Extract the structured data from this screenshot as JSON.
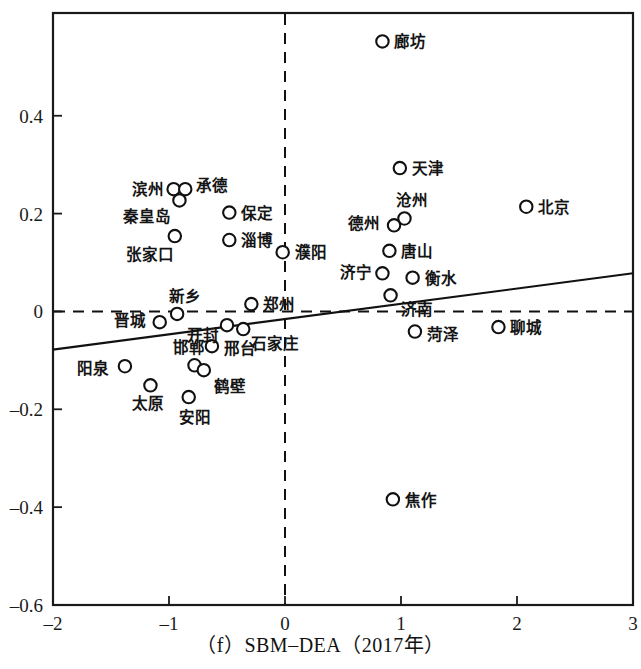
{
  "caption": "（f）SBM–DEA（2017年）",
  "axes": {
    "x_ticks": [
      "-2",
      "-1",
      "0",
      "1",
      "2",
      "3"
    ],
    "x_tick_values": [
      -2,
      -1,
      0,
      1,
      2,
      3
    ],
    "y_ticks": [
      "0.4",
      "0.2",
      "0",
      "-0.2",
      "-0.4",
      "-0.6"
    ],
    "y_tick_values": [
      0.4,
      0.2,
      0,
      -0.2,
      -0.4,
      -0.6
    ],
    "xlim": [
      -2,
      3
    ],
    "ylim": [
      -0.6,
      0.61
    ],
    "xlabel": "",
    "ylabel": ""
  },
  "chart_data": {
    "type": "scatter",
    "title": "（f）SBM–DEA（2017年）",
    "xlabel": "",
    "ylabel": "",
    "xlim": [
      -2,
      3
    ],
    "ylim": [
      -0.6,
      0.61
    ],
    "grid": false,
    "legend": null,
    "reference_lines": [
      {
        "name": "zero-horizontal",
        "orient": "h",
        "value": 0,
        "style": "dashed"
      },
      {
        "name": "zero-vertical",
        "orient": "v",
        "value": 0,
        "style": "dashed"
      }
    ],
    "trend_line": {
      "name": "fitted-regression-line",
      "style": "solid",
      "x0": -2,
      "y0": -0.078,
      "x1": 3,
      "y1": 0.078,
      "slope": 0.0312,
      "intercept": 0.0
    },
    "points": [
      {
        "label": "廊坊",
        "x": 0.84,
        "y": 0.552,
        "lx": 12,
        "ly": 6
      },
      {
        "label": "滨州",
        "x": -0.96,
        "y": 0.25,
        "lx": -42,
        "ly": 6
      },
      {
        "label": "承德",
        "x": -0.86,
        "y": 0.25,
        "lx": 11,
        "ly": 2
      },
      {
        "label": "秦皇岛",
        "x": -0.91,
        "y": 0.227,
        "lx": -56,
        "ly": 22
      },
      {
        "label": "张家口",
        "x": -0.95,
        "y": 0.154,
        "lx": -49,
        "ly": 24
      },
      {
        "label": "保定",
        "x": -0.48,
        "y": 0.202,
        "lx": 12,
        "ly": 6
      },
      {
        "label": "淄博",
        "x": -0.48,
        "y": 0.146,
        "lx": 12,
        "ly": 6
      },
      {
        "label": "濮阳",
        "x": -0.02,
        "y": 0.121,
        "lx": 12,
        "ly": 6
      },
      {
        "label": "天津",
        "x": 0.99,
        "y": 0.293,
        "lx": 12,
        "ly": 6
      },
      {
        "label": "北京",
        "x": 2.08,
        "y": 0.214,
        "lx": 12,
        "ly": 6
      },
      {
        "label": "沧州",
        "x": 1.03,
        "y": 0.19,
        "lx": -8,
        "ly": -12
      },
      {
        "label": "德州",
        "x": 0.94,
        "y": 0.176,
        "lx": -46,
        "ly": 4
      },
      {
        "label": "唐山",
        "x": 0.9,
        "y": 0.124,
        "lx": 12,
        "ly": 6
      },
      {
        "label": "济宁",
        "x": 0.84,
        "y": 0.078,
        "lx": -42,
        "ly": 5
      },
      {
        "label": "衡水",
        "x": 1.1,
        "y": 0.069,
        "lx": 12,
        "ly": 6
      },
      {
        "label": "济南",
        "x": 0.91,
        "y": 0.033,
        "lx": 10,
        "ly": 20
      },
      {
        "label": "菏泽",
        "x": 1.12,
        "y": -0.041,
        "lx": 12,
        "ly": 8
      },
      {
        "label": "聊城",
        "x": 1.84,
        "y": -0.032,
        "lx": 12,
        "ly": 6
      },
      {
        "label": "郑州",
        "x": -0.29,
        "y": 0.015,
        "lx": 12,
        "ly": 6
      },
      {
        "label": "新乡",
        "x": -0.93,
        "y": -0.005,
        "lx": -8,
        "ly": -12
      },
      {
        "label": "晋城",
        "x": -1.08,
        "y": -0.022,
        "lx": -46,
        "ly": 4
      },
      {
        "label": "开封",
        "x": -0.5,
        "y": -0.028,
        "lx": -40,
        "ly": 16
      },
      {
        "label": "石家庄",
        "x": -0.36,
        "y": -0.036,
        "lx": 8,
        "ly": 20
      },
      {
        "label": "邢台",
        "x": -0.63,
        "y": -0.071,
        "lx": 12,
        "ly": 8
      },
      {
        "label": "邯郸",
        "x": -0.78,
        "y": -0.11,
        "lx": -22,
        "ly": -12
      },
      {
        "label": "阳泉",
        "x": -1.38,
        "y": -0.112,
        "lx": -48,
        "ly": 8
      },
      {
        "label": "鹤壁",
        "x": -0.7,
        "y": -0.12,
        "lx": 10,
        "ly": 22
      },
      {
        "label": "太原",
        "x": -1.16,
        "y": -0.151,
        "lx": -18,
        "ly": 24
      },
      {
        "label": "安阳",
        "x": -0.83,
        "y": -0.175,
        "lx": -10,
        "ly": 26
      },
      {
        "label": "焦作",
        "x": 0.93,
        "y": -0.384,
        "lx": 12,
        "ly": 7
      }
    ]
  }
}
